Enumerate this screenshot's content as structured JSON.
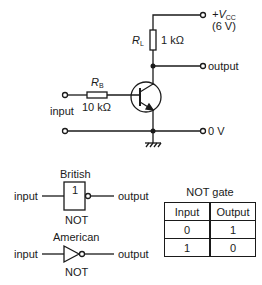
{
  "circuit": {
    "vcc_label": "+V",
    "vcc_sub": "CC",
    "vcc_value": "(6 V)",
    "rl_label": "R",
    "rl_sub": "L",
    "rl_value": "1 kΩ",
    "rb_label": "R",
    "rb_sub": "B",
    "rb_value": "10 kΩ",
    "output_label": "output",
    "input_label": "input",
    "ground_label": "0 V"
  },
  "gates": {
    "british": {
      "title": "British",
      "symbol_text": "1",
      "input_label": "input",
      "output_label": "output",
      "name": "NOT"
    },
    "american": {
      "title": "American",
      "input_label": "input",
      "output_label": "output",
      "name": "NOT"
    }
  },
  "truth_table": {
    "caption": "NOT gate",
    "headers": [
      "Input",
      "Output"
    ],
    "rows": [
      [
        "0",
        "1"
      ],
      [
        "1",
        "0"
      ]
    ]
  }
}
